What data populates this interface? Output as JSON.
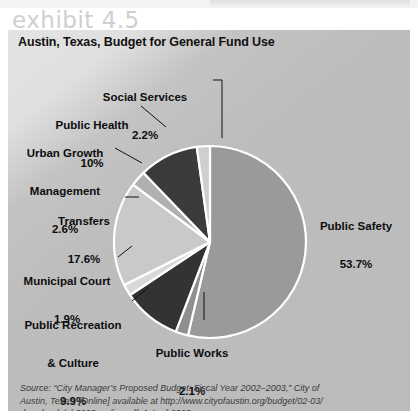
{
  "exhibit_caption": "exhibit 4.5",
  "chart_title": "Austin, Texas, Budget for General Fund Use",
  "source": {
    "line1": "Source: “City Manager’s Proposed Budget: Fiscal Year 2002–2003,” City of",
    "line2": "Austin, Texas, [Online] available at http://www.cityofaustin.org/budget/02-03/",
    "line3": "downloads/ab0203_policy.pdf, 1 April 2003."
  },
  "colors": {
    "panel_bg": "#bbbbbb",
    "public_safety": "#9a9a9a",
    "social_services": "#cfcfcf",
    "public_health": "#3b3b3b",
    "urban_growth": "#b0b0b0",
    "transfers": "#c9c9c9",
    "municipal_court": "#d8d8d8",
    "public_recreation": "#333333",
    "public_works": "#8f8f8f",
    "slice_border": "#ffffff",
    "label_text": "#0d0d0d"
  },
  "chart_data": {
    "type": "pie",
    "title": "Austin, Texas, Budget for General Fund Use",
    "units": "percent",
    "legend": "none",
    "labels_position": "outside-with-leader-lines",
    "start_angle_deg": -90,
    "direction": "clockwise",
    "categories": [
      "Public Safety",
      "Public Works",
      "Public Recreation & Culture",
      "Municipal Court",
      "Transfers",
      "Urban Growth Management",
      "Public Health",
      "Social Services"
    ],
    "values": [
      53.7,
      2.1,
      9.9,
      1.9,
      17.6,
      2.6,
      10.0,
      2.2
    ],
    "slices": [
      {
        "name": "Public Safety",
        "value": 53.7,
        "display": "53.7%",
        "color": "#9a9a9a"
      },
      {
        "name": "Public Works",
        "value": 2.1,
        "display": "2.1%",
        "color": "#8f8f8f"
      },
      {
        "name": "Public Recreation & Culture",
        "value": 9.9,
        "display": "9.9%",
        "color": "#333333"
      },
      {
        "name": "Municipal Court",
        "value": 1.9,
        "display": "1.9%",
        "color": "#d8d8d8"
      },
      {
        "name": "Transfers",
        "value": 17.6,
        "display": "17.6%",
        "color": "#c9c9c9"
      },
      {
        "name": "Urban Growth Management",
        "value": 2.6,
        "display": "2.6%",
        "color": "#b0b0b0"
      },
      {
        "name": "Public Health",
        "value": 10.0,
        "display": "10%",
        "color": "#3b3b3b"
      },
      {
        "name": "Social Services",
        "value": 2.2,
        "display": "2.2%",
        "color": "#cfcfcf"
      }
    ]
  },
  "labels": {
    "social_services": {
      "name": "Social Services",
      "pct": "2.2%"
    },
    "public_health": {
      "name": "Public Health",
      "pct": "10%"
    },
    "urban_growth": {
      "name1": "Urban Growth",
      "name2": "Management",
      "pct": "2.6%"
    },
    "transfers": {
      "name": "Transfers",
      "pct": "17.6%"
    },
    "municipal_court": {
      "name": "Municipal Court",
      "pct": "1.9%"
    },
    "public_recreation": {
      "name1": "Public Recreation",
      "name2": "& Culture",
      "pct": "9.9%"
    },
    "public_works": {
      "name": "Public Works",
      "pct": "2.1%"
    },
    "public_safety": {
      "name": "Public Safety",
      "pct": "53.7%"
    }
  }
}
